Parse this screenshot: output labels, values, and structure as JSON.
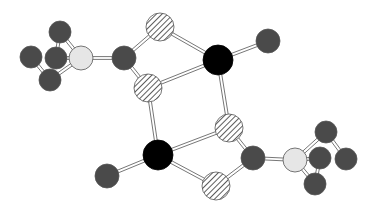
{
  "diagram": {
    "type": "ball-and-stick molecular structure",
    "legend_styles": {
      "dark": {
        "fill": "#4a4a4a",
        "description": "dark grey atom"
      },
      "black": {
        "fill": "#000000",
        "description": "black atom"
      },
      "hatched": {
        "fill": "hatch",
        "description": "diagonally hatched atom"
      },
      "light": {
        "fill": "#e6e6e6",
        "description": "light grey atom"
      }
    },
    "atoms": [
      {
        "id": "a1",
        "style": "dark",
        "x": 60,
        "y": 32,
        "r": 11
      },
      {
        "id": "a2",
        "style": "dark",
        "x": 31,
        "y": 57,
        "r": 11
      },
      {
        "id": "a3",
        "style": "dark",
        "x": 56,
        "y": 58,
        "r": 11
      },
      {
        "id": "a4",
        "style": "dark",
        "x": 50,
        "y": 80,
        "r": 11
      },
      {
        "id": "a5",
        "style": "light",
        "x": 81,
        "y": 58,
        "r": 12
      },
      {
        "id": "a6",
        "style": "dark",
        "x": 124,
        "y": 58,
        "r": 12
      },
      {
        "id": "a7",
        "style": "hatched",
        "x": 160,
        "y": 27,
        "r": 14
      },
      {
        "id": "a8",
        "style": "hatched",
        "x": 148,
        "y": 88,
        "r": 14
      },
      {
        "id": "a9",
        "style": "black",
        "x": 218,
        "y": 60,
        "r": 15
      },
      {
        "id": "a10",
        "style": "dark",
        "x": 268,
        "y": 41,
        "r": 12
      },
      {
        "id": "a11",
        "style": "hatched",
        "x": 229,
        "y": 128,
        "r": 14
      },
      {
        "id": "a12",
        "style": "black",
        "x": 158,
        "y": 155,
        "r": 15
      },
      {
        "id": "a13",
        "style": "dark",
        "x": 107,
        "y": 176,
        "r": 12
      },
      {
        "id": "a14",
        "style": "dark",
        "x": 253,
        "y": 158,
        "r": 12
      },
      {
        "id": "a15",
        "style": "hatched",
        "x": 216,
        "y": 186,
        "r": 14
      },
      {
        "id": "a16",
        "style": "light",
        "x": 295,
        "y": 160,
        "r": 12
      },
      {
        "id": "a17",
        "style": "dark",
        "x": 326,
        "y": 132,
        "r": 11
      },
      {
        "id": "a18",
        "style": "dark",
        "x": 320,
        "y": 158,
        "r": 11
      },
      {
        "id": "a19",
        "style": "dark",
        "x": 346,
        "y": 159,
        "r": 11
      },
      {
        "id": "a20",
        "style": "dark",
        "x": 315,
        "y": 184,
        "r": 11
      }
    ],
    "bonds": [
      [
        "a1",
        "a5"
      ],
      [
        "a2",
        "a4"
      ],
      [
        "a3",
        "a1"
      ],
      [
        "a4",
        "a5"
      ],
      [
        "a3",
        "a5"
      ],
      [
        "a5",
        "a6"
      ],
      [
        "a6",
        "a7"
      ],
      [
        "a6",
        "a8"
      ],
      [
        "a7",
        "a9"
      ],
      [
        "a8",
        "a9"
      ],
      [
        "a9",
        "a10"
      ],
      [
        "a9",
        "a11"
      ],
      [
        "a8",
        "a12"
      ],
      [
        "a11",
        "a12"
      ],
      [
        "a12",
        "a13"
      ],
      [
        "a12",
        "a15"
      ],
      [
        "a11",
        "a14"
      ],
      [
        "a15",
        "a14"
      ],
      [
        "a14",
        "a16"
      ],
      [
        "a16",
        "a17"
      ],
      [
        "a16",
        "a20"
      ],
      [
        "a17",
        "a19"
      ],
      [
        "a18",
        "a20"
      ],
      [
        "a16",
        "a18"
      ]
    ]
  }
}
